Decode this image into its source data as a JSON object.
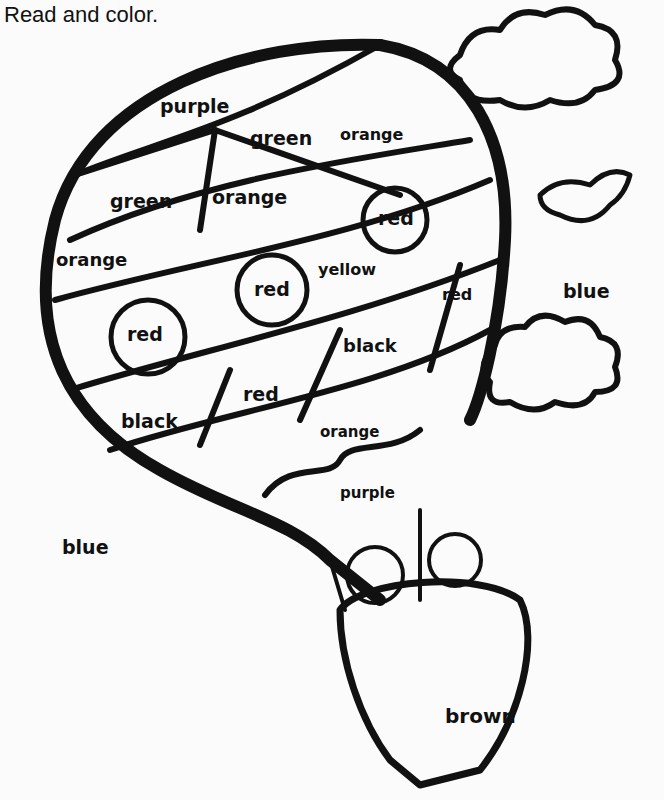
{
  "instruction": "Read and color.",
  "labels": {
    "purple_top": "purple",
    "green_1": "green",
    "orange_1": "orange",
    "green_2": "green",
    "orange_2": "orange",
    "red_circle_1": "red",
    "orange_3": "orange",
    "red_circle_2": "red",
    "yellow": "yellow",
    "red_1": "red",
    "sky_blue_right": "blue",
    "red_circle_3": "red",
    "black_1": "black",
    "red_2": "red",
    "black_2": "black",
    "orange_4": "orange",
    "purple_bottom": "purple",
    "sky_blue_left": "blue",
    "brown": "brown"
  }
}
